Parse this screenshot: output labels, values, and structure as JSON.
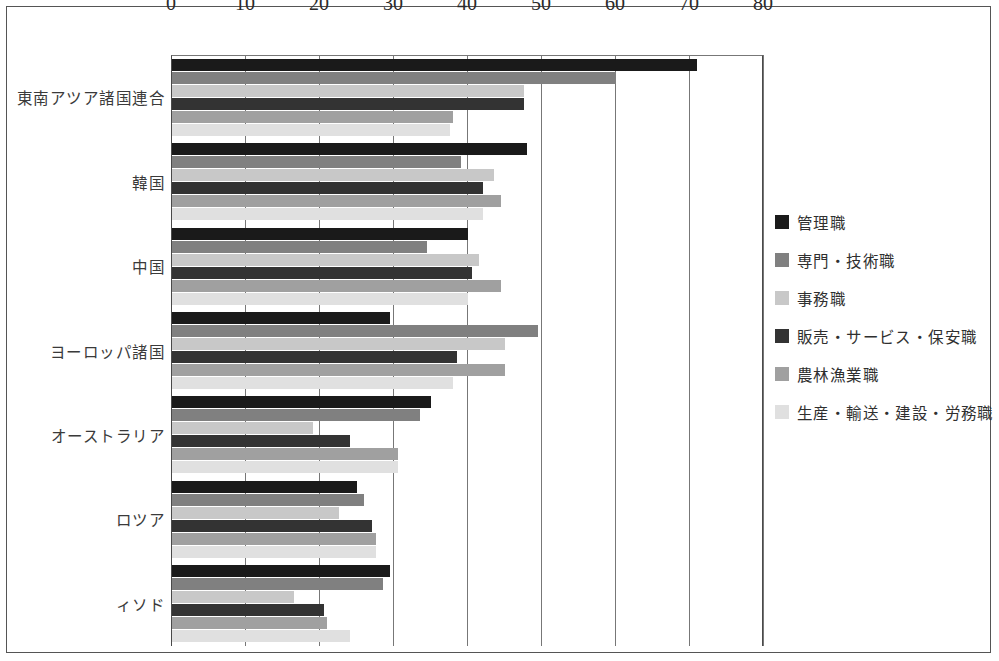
{
  "chart_data": {
    "type": "bar",
    "orientation": "horizontal",
    "title": "",
    "xlabel": "",
    "ylabel": "",
    "xlim": [
      0,
      80
    ],
    "xticks": [
      0,
      10,
      20,
      30,
      40,
      50,
      60,
      70,
      80
    ],
    "grid": true,
    "legend_position": "right",
    "categories": [
      "東南アツア諸国連合",
      "韓国",
      "中国",
      "ヨーロッパ諸国",
      "オーストラリア",
      "ロツア",
      "ィソド"
    ],
    "series": [
      {
        "name": "管理職",
        "color": "#1a1a1a",
        "values": [
          71,
          48,
          40,
          29.5,
          35,
          25,
          29.5
        ]
      },
      {
        "name": "専門・技術職",
        "color": "#808080",
        "values": [
          60,
          39,
          34.5,
          49.5,
          33.5,
          26,
          28.5
        ]
      },
      {
        "name": "事務職",
        "color": "#c8c8c8",
        "values": [
          47.5,
          43.5,
          41.5,
          45,
          19,
          22.5,
          16.5
        ]
      },
      {
        "name": "販売・サービス・保安職",
        "color": "#333333",
        "values": [
          47.5,
          42,
          40.5,
          38.5,
          24,
          27,
          20.5
        ]
      },
      {
        "name": "農林漁業職",
        "color": "#a0a0a0",
        "values": [
          38,
          44.5,
          44.5,
          45,
          30.5,
          27.5,
          21
        ]
      },
      {
        "name": "生産・輸送・建設・労務職",
        "color": "#e0e0e0",
        "values": [
          37.5,
          42,
          40,
          38,
          30.5,
          27.5,
          24
        ]
      }
    ]
  }
}
